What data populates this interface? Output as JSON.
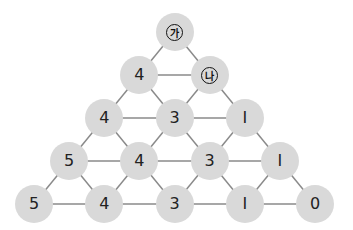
{
  "diagram": {
    "type": "number-triangle",
    "colors": {
      "node_fill": "#d9d9d9",
      "edge": "#8a8a8a",
      "text": "#222222"
    },
    "rows": [
      [
        {
          "label": "가",
          "unknown": true
        }
      ],
      [
        {
          "label": "4"
        },
        {
          "label": "나",
          "unknown": true
        }
      ],
      [
        {
          "label": "4"
        },
        {
          "label": "3"
        },
        {
          "label": "1"
        }
      ],
      [
        {
          "label": "5"
        },
        {
          "label": "4"
        },
        {
          "label": "3"
        },
        {
          "label": "1"
        }
      ],
      [
        {
          "label": "5"
        },
        {
          "label": "4"
        },
        {
          "label": "3"
        },
        {
          "label": "1"
        },
        {
          "label": "0"
        }
      ]
    ]
  }
}
